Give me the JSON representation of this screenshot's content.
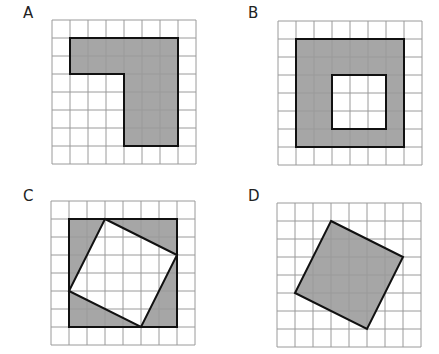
{
  "colors": {
    "grid_line": "#9a9a9a",
    "shape_fill": "#a6a6a6",
    "shape_stroke": "#111111",
    "background": "#ffffff"
  },
  "grid": {
    "cells": 8,
    "cell_px": 18
  },
  "panels": [
    {
      "label": "A",
      "description": "L-shaped shaded region on 8x8 grid",
      "label_pos": [
        23,
        6
      ],
      "origin": [
        51,
        19
      ],
      "shapes": [
        {
          "kind": "polygon",
          "fill": true,
          "points": [
            [
              1,
              1
            ],
            [
              7,
              1
            ],
            [
              7,
              7
            ],
            [
              4,
              7
            ],
            [
              4,
              3
            ],
            [
              1,
              3
            ]
          ]
        }
      ]
    },
    {
      "label": "B",
      "description": "6x6 shaded square with 3x3 unshaded square hole",
      "label_pos": [
        248,
        6
      ],
      "origin": [
        277,
        20
      ],
      "shapes": [
        {
          "kind": "polygon",
          "fill": true,
          "points": [
            [
              1,
              1
            ],
            [
              7,
              1
            ],
            [
              7,
              7
            ],
            [
              1,
              7
            ]
          ]
        },
        {
          "kind": "polygon",
          "fill": false,
          "white": true,
          "points": [
            [
              3,
              3
            ],
            [
              6,
              3
            ],
            [
              6,
              6
            ],
            [
              3,
              6
            ]
          ]
        }
      ]
    },
    {
      "label": "C",
      "description": "6x6 shaded square with tilted unshaded square inside",
      "label_pos": [
        23,
        189
      ],
      "origin": [
        50,
        200
      ],
      "shapes": [
        {
          "kind": "polygon",
          "fill": true,
          "points": [
            [
              1,
              1
            ],
            [
              7,
              1
            ],
            [
              7,
              7
            ],
            [
              1,
              7
            ]
          ]
        },
        {
          "kind": "polygon",
          "fill": false,
          "white": true,
          "points": [
            [
              3,
              1
            ],
            [
              7,
              3
            ],
            [
              5,
              7
            ],
            [
              1,
              5
            ]
          ]
        }
      ]
    },
    {
      "label": "D",
      "description": "Tilted shaded square on 8x8 grid",
      "label_pos": [
        248,
        189
      ],
      "origin": [
        276,
        202
      ],
      "shapes": [
        {
          "kind": "polygon",
          "fill": true,
          "points": [
            [
              3,
              1
            ],
            [
              7,
              3
            ],
            [
              5,
              7
            ],
            [
              1,
              5
            ]
          ]
        }
      ]
    }
  ]
}
